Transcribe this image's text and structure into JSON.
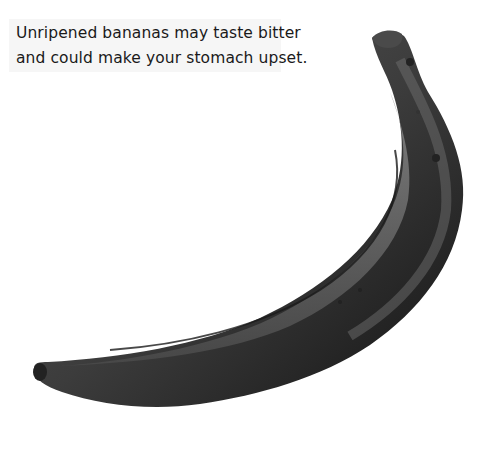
{
  "caption": {
    "lines": [
      "Unripened bananas may taste bitter",
      "and could make your stomach upset."
    ],
    "background": "#f6f6f6"
  },
  "image": {
    "subject": "banana-photo",
    "tone": "grayscale"
  }
}
